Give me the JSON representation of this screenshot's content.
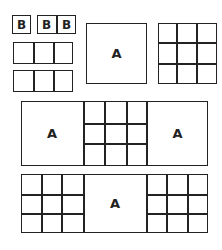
{
  "diagram": {
    "label_a": "A",
    "label_b": "B",
    "line_color": "#222222",
    "background": "#ffffff",
    "b_tiles": [
      {
        "label": "B"
      },
      {
        "label": "B"
      },
      {
        "label": "B"
      }
    ],
    "strips": {
      "middle": [
        "A",
        "3x3 grid",
        "A"
      ],
      "bottom": [
        "3x3 grid",
        "A",
        "3x3 grid"
      ]
    }
  }
}
